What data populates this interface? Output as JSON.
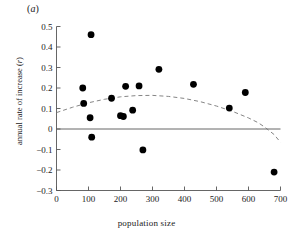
{
  "figure": {
    "panel_label_prefix": "(",
    "panel_label_letter": "a",
    "panel_label_suffix": ")",
    "panel_label_full": "(a)"
  },
  "axes": {
    "x_title": "population size",
    "y_title_prefix": "annual rate of increase (",
    "y_title_symbol": "r",
    "y_title_suffix": ")",
    "y_title_full": "annual rate of increase (r)",
    "x_ticks": [
      "0",
      "100",
      "200",
      "300",
      "400",
      "500",
      "600",
      "700"
    ],
    "y_ticks": [
      "0.5",
      "0.4",
      "0.3",
      "0.2",
      "0.1",
      "0",
      "−0.1",
      "−0.2",
      "−0.3"
    ]
  },
  "colors": {
    "marker": "#000000",
    "axis": "#555555",
    "zero_line": "#555555",
    "trend": "#777777",
    "text": "#1a1a1a",
    "background": "#ffffff"
  },
  "chart_data": {
    "type": "scatter",
    "title": "",
    "subtitle": "",
    "xlabel": "population size",
    "ylabel": "annual rate of increase (r)",
    "xlim": [
      0,
      700
    ],
    "ylim": [
      -0.3,
      0.5
    ],
    "xticks": [
      0,
      100,
      200,
      300,
      400,
      500,
      600,
      700
    ],
    "yticks": [
      -0.3,
      -0.2,
      -0.1,
      0,
      0.1,
      0.2,
      0.3,
      0.4,
      0.5
    ],
    "grid": false,
    "legend": false,
    "legend_position": "none",
    "annotations": [
      "(a)"
    ],
    "marker_style": "filled-circle",
    "series": [
      {
        "name": "populations",
        "points": [
          {
            "x": 82,
            "y": 0.2
          },
          {
            "x": 85,
            "y": 0.125
          },
          {
            "x": 105,
            "y": 0.055
          },
          {
            "x": 108,
            "y": 0.46
          },
          {
            "x": 110,
            "y": -0.04
          },
          {
            "x": 172,
            "y": 0.15
          },
          {
            "x": 200,
            "y": 0.065
          },
          {
            "x": 209,
            "y": 0.061
          },
          {
            "x": 216,
            "y": 0.208
          },
          {
            "x": 238,
            "y": 0.092
          },
          {
            "x": 258,
            "y": 0.21
          },
          {
            "x": 270,
            "y": -0.102
          },
          {
            "x": 320,
            "y": 0.291
          },
          {
            "x": 428,
            "y": 0.218
          },
          {
            "x": 540,
            "y": 0.102
          },
          {
            "x": 590,
            "y": 0.178
          },
          {
            "x": 680,
            "y": -0.21
          }
        ]
      }
    ],
    "trend_line": {
      "name": "fitted quadratic",
      "style": "dashed",
      "description": "downward-opening parabola peaking near x=300",
      "points": [
        {
          "x": 0,
          "y": 0.08
        },
        {
          "x": 50,
          "y": 0.106
        },
        {
          "x": 100,
          "y": 0.128
        },
        {
          "x": 150,
          "y": 0.145
        },
        {
          "x": 200,
          "y": 0.157
        },
        {
          "x": 250,
          "y": 0.163
        },
        {
          "x": 300,
          "y": 0.164
        },
        {
          "x": 350,
          "y": 0.159
        },
        {
          "x": 400,
          "y": 0.149
        },
        {
          "x": 450,
          "y": 0.133
        },
        {
          "x": 500,
          "y": 0.112
        },
        {
          "x": 550,
          "y": 0.086
        },
        {
          "x": 600,
          "y": 0.054
        },
        {
          "x": 630,
          "y": 0.031
        },
        {
          "x": 650,
          "y": 0.01
        },
        {
          "x": 680,
          "y": -0.027
        },
        {
          "x": 700,
          "y": -0.065
        }
      ]
    },
    "zero_reference_line": 0
  }
}
